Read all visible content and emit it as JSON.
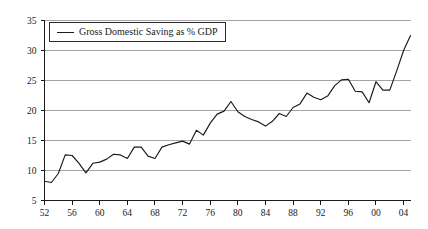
{
  "chart_data": {
    "type": "line",
    "title": "",
    "subtitle": "",
    "xlabel": "",
    "ylabel": "",
    "grid": true,
    "grid_axis": "y",
    "legend_position": "top-left",
    "xlim": [
      1952,
      2005
    ],
    "ylim": [
      5,
      35
    ],
    "y_ticks": [
      5,
      10,
      15,
      20,
      25,
      30,
      35
    ],
    "y_tick_labels": [
      "5",
      "10",
      "15",
      "20",
      "25",
      "30",
      "35"
    ],
    "x_ticks": [
      1952,
      1956,
      1960,
      1964,
      1968,
      1972,
      1976,
      1980,
      1984,
      1988,
      1992,
      1996,
      2000,
      2004
    ],
    "x_tick_labels": [
      "52",
      "56",
      "60",
      "64",
      "68",
      "72",
      "76",
      "80",
      "84",
      "88",
      "92",
      "96",
      "00",
      "04"
    ],
    "legend": [
      "Gross Domestic Saving as % GDP"
    ],
    "series": [
      {
        "name": "Gross Domestic Saving as % GDP",
        "color": "#1a1a1a",
        "x": [
          1952,
          1953,
          1954,
          1955,
          1956,
          1957,
          1958,
          1959,
          1960,
          1961,
          1962,
          1963,
          1964,
          1965,
          1966,
          1967,
          1968,
          1969,
          1970,
          1971,
          1972,
          1973,
          1974,
          1975,
          1976,
          1977,
          1978,
          1979,
          1980,
          1981,
          1982,
          1983,
          1984,
          1985,
          1986,
          1987,
          1988,
          1989,
          1990,
          1991,
          1992,
          1993,
          1994,
          1995,
          1996,
          1997,
          1998,
          1999,
          2000,
          2001,
          2002,
          2003,
          2004,
          2005
        ],
        "values": [
          8.2,
          8.0,
          9.5,
          12.6,
          12.5,
          11.2,
          9.6,
          11.2,
          11.4,
          11.9,
          12.7,
          12.6,
          12.0,
          13.9,
          13.9,
          12.4,
          12.0,
          13.9,
          14.3,
          14.6,
          14.9,
          14.4,
          16.7,
          15.9,
          17.9,
          19.4,
          19.9,
          21.5,
          19.8,
          19.0,
          18.5,
          18.1,
          17.4,
          18.2,
          19.5,
          19.0,
          20.5,
          21.1,
          22.9,
          22.2,
          21.8,
          22.4,
          24.1,
          25.1,
          25.2,
          23.2,
          23.1,
          21.3,
          24.8,
          23.4,
          23.4,
          26.6,
          30.0,
          32.5
        ]
      }
    ]
  },
  "legend": {
    "label": "Gross Domestic Saving as % GDP"
  }
}
